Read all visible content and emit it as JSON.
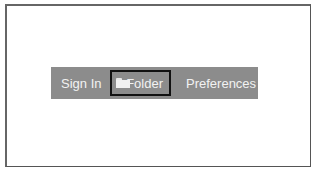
{
  "menu": {
    "items": [
      {
        "label": "Sign In",
        "icon": null,
        "selected": false
      },
      {
        "label": "Folder",
        "icon": "folder-icon",
        "selected": true
      },
      {
        "label": "Preferences",
        "icon": null,
        "selected": false
      }
    ]
  },
  "colors": {
    "menubar_bg": "#8c8c8c",
    "menu_text": "#f2f2f2",
    "focus_border": "#111111"
  }
}
